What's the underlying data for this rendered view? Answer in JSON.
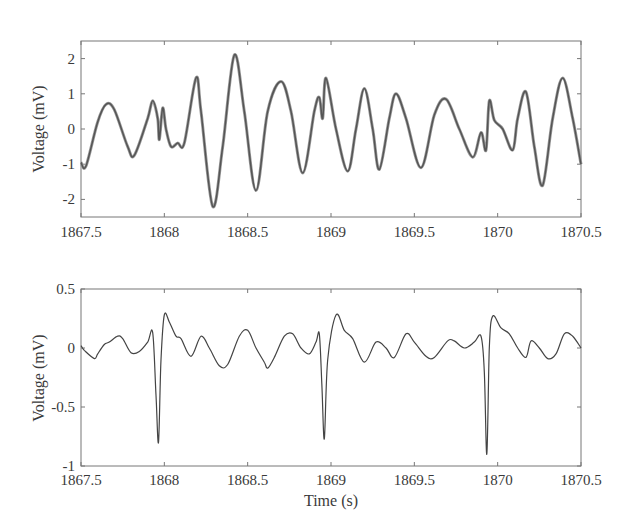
{
  "chart_data": [
    {
      "type": "line",
      "title": "",
      "xlabel": "",
      "ylabel": "Voltage (mV)",
      "xlim": [
        1867.5,
        1870.5
      ],
      "ylim": [
        -2.5,
        2.5
      ],
      "xticks": [
        1867.5,
        1868,
        1868.5,
        1869,
        1869.5,
        1870,
        1870.5
      ],
      "xtick_labels": [
        "1867.5",
        "1868",
        "1868.5",
        "1869",
        "1869.5",
        "1870",
        "1870.5"
      ],
      "yticks": [
        2,
        1,
        0,
        -1,
        -2
      ],
      "ytick_labels": [
        "2",
        "1",
        "0",
        "-1",
        "-2"
      ],
      "grid": false,
      "legend": null,
      "series": [
        {
          "name": "signal",
          "color": "#555555",
          "x": [
            1867.5,
            1867.53,
            1867.6,
            1867.65,
            1867.7,
            1867.78,
            1867.82,
            1867.9,
            1867.93,
            1867.96,
            1867.97,
            1867.99,
            1868.01,
            1868.04,
            1868.08,
            1868.12,
            1868.19,
            1868.22,
            1868.29,
            1868.35,
            1868.42,
            1868.48,
            1868.55,
            1868.62,
            1868.7,
            1868.76,
            1868.83,
            1868.9,
            1868.93,
            1868.95,
            1868.97,
            1869.03,
            1869.1,
            1869.15,
            1869.2,
            1869.25,
            1869.29,
            1869.35,
            1869.39,
            1869.45,
            1869.54,
            1869.62,
            1869.69,
            1869.77,
            1869.85,
            1869.9,
            1869.93,
            1869.95,
            1869.98,
            1870.03,
            1870.09,
            1870.12,
            1870.17,
            1870.22,
            1870.27,
            1870.33,
            1870.39,
            1870.45,
            1870.5
          ],
          "values": [
            -0.95,
            -1.05,
            0.2,
            0.7,
            0.55,
            -0.5,
            -0.75,
            0.3,
            0.8,
            0.3,
            -0.3,
            0.6,
            0.0,
            -0.5,
            -0.4,
            -0.4,
            1.45,
            0.5,
            -2.2,
            -0.5,
            2.1,
            0.5,
            -1.75,
            0.5,
            1.35,
            0.5,
            -1.25,
            0.5,
            0.9,
            0.3,
            1.45,
            0.0,
            -1.2,
            0.0,
            1.15,
            0.0,
            -1.15,
            0.3,
            1.0,
            0.3,
            -1.1,
            0.4,
            0.85,
            0.0,
            -0.8,
            -0.1,
            -0.6,
            0.8,
            0.25,
            0.0,
            -0.6,
            0.3,
            1.05,
            -0.5,
            -1.6,
            0.3,
            1.45,
            0.3,
            -1.0
          ]
        }
      ]
    },
    {
      "type": "line",
      "title": "",
      "xlabel": "Time (s)",
      "ylabel": "Voltage (mV)",
      "xlim": [
        1867.5,
        1870.5
      ],
      "ylim": [
        -1,
        0.5
      ],
      "xticks": [
        1867.5,
        1868,
        1868.5,
        1869,
        1869.5,
        1870,
        1870.5
      ],
      "xtick_labels": [
        "1867.5",
        "1868",
        "1868.5",
        "1869",
        "1869.5",
        "1870",
        "1870.5"
      ],
      "yticks": [
        0.5,
        0,
        -0.5,
        -1
      ],
      "ytick_labels": [
        "0.5",
        "0",
        "-0.5",
        "-1"
      ],
      "grid": false,
      "legend": null,
      "series": [
        {
          "name": "signal",
          "color": "#444444",
          "x": [
            1867.5,
            1867.52,
            1867.58,
            1867.6,
            1867.64,
            1867.67,
            1867.72,
            1867.75,
            1867.8,
            1867.85,
            1867.9,
            1867.93,
            1867.95,
            1867.965,
            1867.98,
            1868.0,
            1868.03,
            1868.07,
            1868.1,
            1868.16,
            1868.22,
            1868.27,
            1868.33,
            1868.38,
            1868.45,
            1868.5,
            1868.55,
            1868.6,
            1868.62,
            1868.66,
            1868.72,
            1868.77,
            1868.82,
            1868.87,
            1868.91,
            1868.93,
            1868.945,
            1868.96,
            1868.98,
            1869.03,
            1869.08,
            1869.13,
            1869.2,
            1869.27,
            1869.33,
            1869.38,
            1869.45,
            1869.5,
            1869.57,
            1869.62,
            1869.7,
            1869.74,
            1869.8,
            1869.86,
            1869.9,
            1869.92,
            1869.935,
            1869.95,
            1869.97,
            1870.02,
            1870.07,
            1870.12,
            1870.17,
            1870.2,
            1870.25,
            1870.3,
            1870.35,
            1870.4,
            1870.45,
            1870.5
          ],
          "values": [
            0.02,
            -0.02,
            -0.09,
            -0.05,
            0.03,
            0.05,
            0.1,
            0.08,
            -0.04,
            -0.03,
            0.05,
            0.13,
            -0.4,
            -0.8,
            -0.1,
            0.28,
            0.22,
            0.1,
            0.08,
            -0.07,
            0.1,
            0.0,
            -0.15,
            -0.14,
            0.1,
            0.15,
            0.0,
            -0.12,
            -0.17,
            -0.08,
            0.1,
            0.12,
            0.0,
            -0.05,
            0.05,
            0.12,
            -0.3,
            -0.77,
            -0.1,
            0.28,
            0.15,
            0.08,
            -0.12,
            0.05,
            0.0,
            -0.08,
            0.12,
            0.05,
            -0.07,
            -0.08,
            0.06,
            0.06,
            0.0,
            0.05,
            0.1,
            -0.2,
            -0.9,
            0.0,
            0.27,
            0.17,
            0.12,
            0.0,
            -0.08,
            0.06,
            0.0,
            -0.09,
            -0.05,
            0.12,
            0.1,
            0.0
          ]
        }
      ]
    }
  ],
  "plots": [
    {
      "ylabel": "Voltage (mV)",
      "xlabel": "",
      "xtick_labels": [
        "1867.5",
        "1868",
        "1868.5",
        "1869",
        "1869.5",
        "1870",
        "1870.5"
      ],
      "ytick_labels": [
        "2",
        "1",
        "0",
        "-1",
        "-2"
      ]
    },
    {
      "ylabel": "Voltage (mV)",
      "xlabel": "Time (s)",
      "xtick_labels": [
        "1867.5",
        "1868",
        "1868.5",
        "1869",
        "1869.5",
        "1870",
        "1870.5"
      ],
      "ytick_labels": [
        "0.5",
        "0",
        "-0.5",
        "-1"
      ]
    }
  ]
}
